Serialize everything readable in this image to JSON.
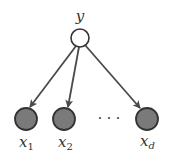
{
  "diagram": {
    "type": "graphical-model",
    "colors": {
      "background": "#ffffff",
      "edge": "#4a4a4a",
      "node_stroke": "#333333",
      "observed_fill": "#7a7a7a",
      "latent_fill": "#ffffff",
      "text": "#333333"
    },
    "parent": {
      "id": "y",
      "label": "y",
      "observed": false
    },
    "children": [
      {
        "id": "x1",
        "label": "x",
        "subscript": "1",
        "observed": true
      },
      {
        "id": "x2",
        "label": "x",
        "subscript": "2",
        "observed": true
      },
      {
        "id": "xd",
        "label": "x",
        "subscript": "d",
        "observed": true
      }
    ],
    "ellipsis": "· · ·",
    "edges": [
      {
        "from": "y",
        "to": "x1"
      },
      {
        "from": "y",
        "to": "x2"
      },
      {
        "from": "y",
        "to": "xd"
      }
    ]
  }
}
